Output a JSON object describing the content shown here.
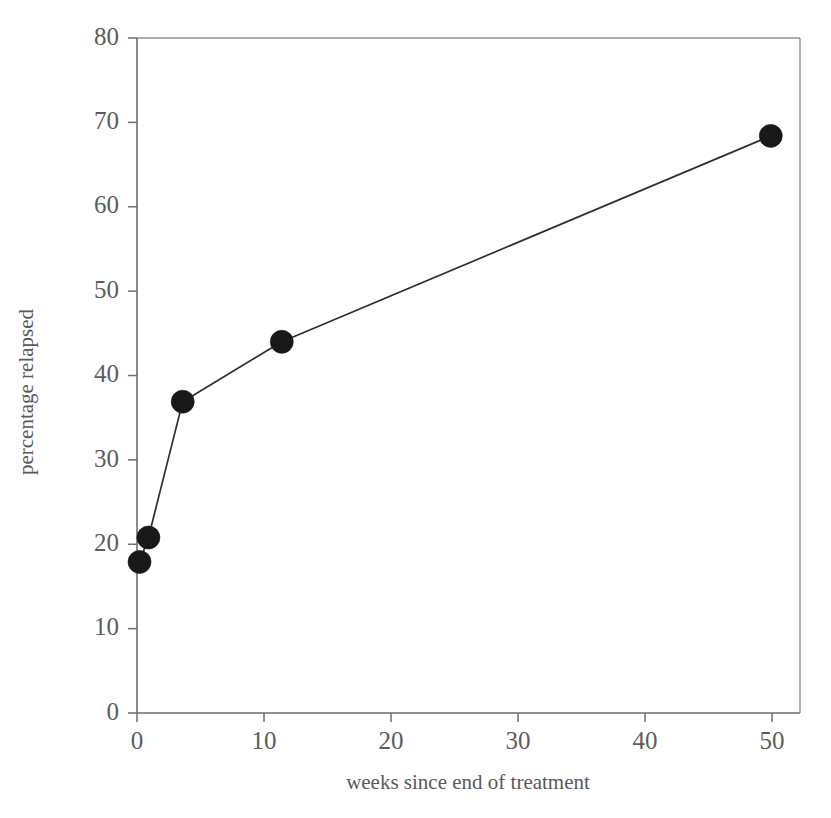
{
  "chart_data": {
    "type": "line",
    "title": "",
    "xlabel": "weeks since end of treatment",
    "ylabel": "percentage relapsed",
    "xlim": [
      0,
      52.2
    ],
    "ylim": [
      0,
      80
    ],
    "xticks": [
      0,
      10,
      20,
      30,
      40,
      50
    ],
    "xtick_labels": [
      "0",
      "10",
      "20",
      "30",
      "40",
      "50"
    ],
    "yticks": [
      0,
      10,
      20,
      30,
      40,
      50,
      60,
      70,
      80
    ],
    "ytick_labels": [
      "0",
      "10",
      "20",
      "30",
      "40",
      "50",
      "60",
      "70",
      "80"
    ],
    "grid": false,
    "legend": false,
    "legend_position": "none",
    "marker": "filled-circle",
    "marker_color": "#181818",
    "line_color": "#2e2e2e",
    "series": [
      {
        "name": "percentage relapsed",
        "x": [
          0.2,
          0.9,
          3.6,
          11.4,
          49.9
        ],
        "y": [
          17.9,
          20.8,
          36.9,
          44.0,
          68.4
        ],
        "points": [
          {
            "x": 0.2,
            "y": 17.9
          },
          {
            "x": 0.9,
            "y": 20.8
          },
          {
            "x": 3.6,
            "y": 36.9
          },
          {
            "x": 11.4,
            "y": 44.0
          },
          {
            "x": 49.9,
            "y": 68.4
          }
        ]
      }
    ]
  },
  "geometry": {
    "plot_left": 137,
    "plot_right": 800,
    "plot_top": 38,
    "plot_bottom": 713,
    "xlabel_x": 468,
    "xlabel_y": 789,
    "ylabel_x": 33,
    "ylabel_y": 392
  }
}
